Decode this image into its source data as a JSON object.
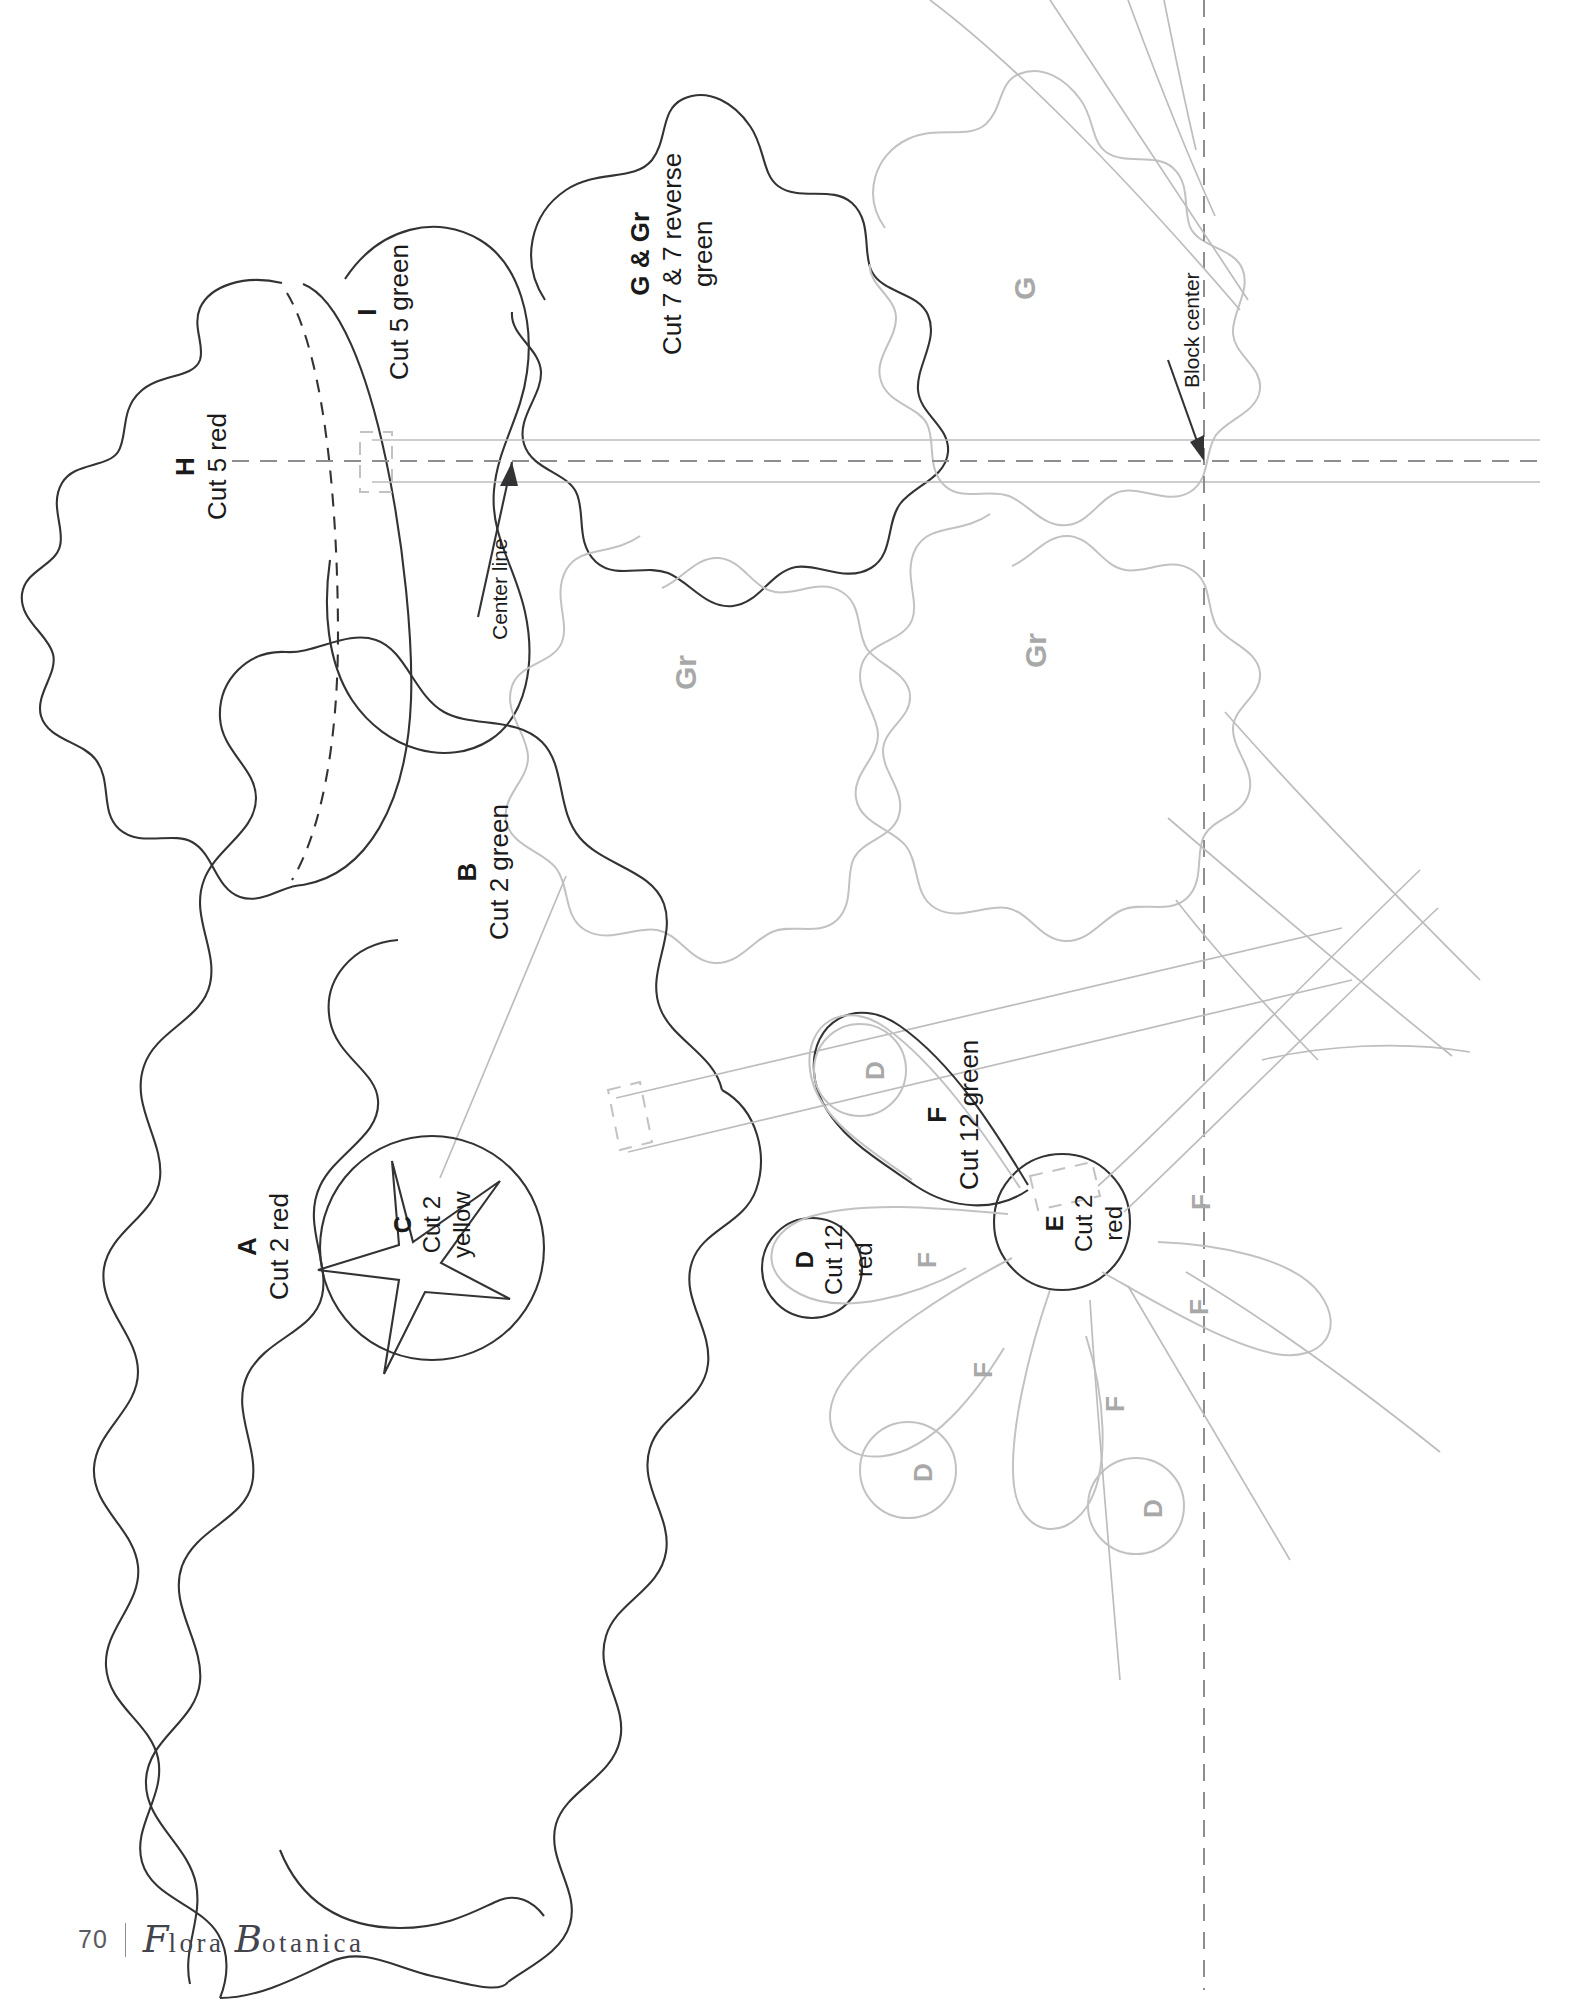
{
  "page": {
    "number": "70",
    "book_title_part1": "lora",
    "book_title_part2": "otanica",
    "book_title_initial1": "F",
    "book_title_initial2": "B"
  },
  "colors": {
    "ink": "#1a1a1a",
    "ghost": "#a8a8a8",
    "faint": "#bcbcbc",
    "footer": "#5a5a62"
  },
  "annotations": [
    {
      "name": "center-line",
      "label": "Center line"
    },
    {
      "name": "block-center",
      "label": "Block center"
    }
  ],
  "pieces": [
    {
      "key": "H",
      "code": "H",
      "cut": "Cut 5 red"
    },
    {
      "key": "I",
      "code": "I",
      "cut": "Cut 5 green"
    },
    {
      "key": "GGr",
      "code": "G & Gr",
      "cut": "Cut 7 & 7 reverse\ngreen",
      "cut_line1": "Cut 7 & 7 reverse",
      "cut_line2": "green"
    },
    {
      "key": "A",
      "code": "A",
      "cut": "Cut 2 red"
    },
    {
      "key": "B",
      "code": "B",
      "cut": "Cut 2 green"
    },
    {
      "key": "C",
      "code": "C",
      "cut_line1": "Cut 2",
      "cut_line2": "yellow"
    },
    {
      "key": "D",
      "code": "D",
      "cut_line1": "Cut 12",
      "cut_line2": "red"
    },
    {
      "key": "E",
      "code": "E",
      "cut_line1": "Cut 2",
      "cut_line2": "red"
    },
    {
      "key": "F",
      "code": "F",
      "cut": "Cut 12 green"
    }
  ],
  "ghost_labels": [
    {
      "name": "ghost-g-upper",
      "text": "G"
    },
    {
      "name": "ghost-gr-left",
      "text": "Gr"
    },
    {
      "name": "ghost-gr-right",
      "text": "Gr"
    },
    {
      "name": "ghost-d-1",
      "text": "D"
    },
    {
      "name": "ghost-d-2",
      "text": "D"
    },
    {
      "name": "ghost-d-3",
      "text": "D"
    },
    {
      "name": "ghost-f-1",
      "text": "F"
    },
    {
      "name": "ghost-f-2",
      "text": "F"
    },
    {
      "name": "ghost-f-3",
      "text": "F"
    },
    {
      "name": "ghost-f-4",
      "text": "F"
    },
    {
      "name": "ghost-f-5",
      "text": "F"
    }
  ]
}
